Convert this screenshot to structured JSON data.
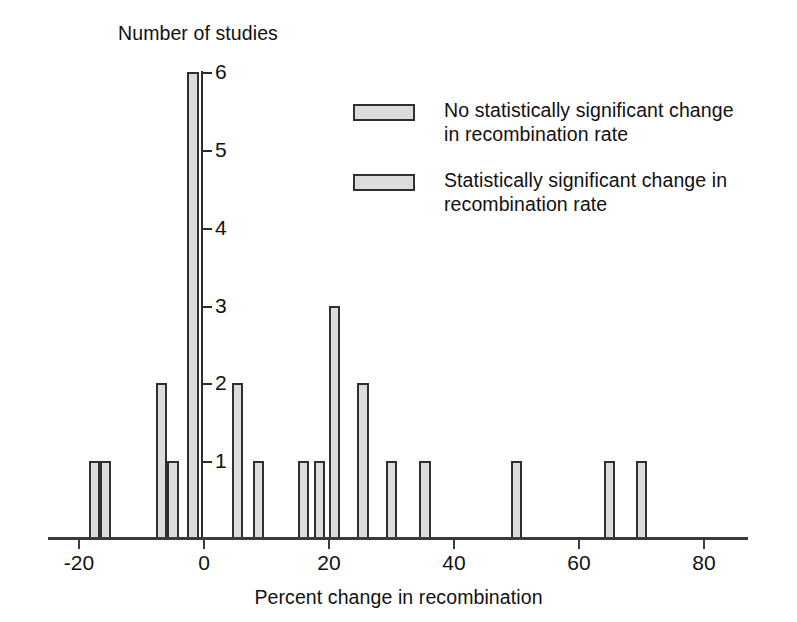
{
  "chart_data": {
    "type": "bar",
    "title": "",
    "ylabel": "Number of studies",
    "xlabel": "Percent change in recombination",
    "xlim": [
      -24,
      88
    ],
    "ylim": [
      0,
      6
    ],
    "grid": false,
    "x_ticks": [
      -20,
      0,
      20,
      40,
      60,
      80
    ],
    "x_tick_labels": [
      "-20",
      "0",
      "20",
      "40",
      "60",
      "80"
    ],
    "y_ticks": [
      1,
      2,
      3,
      4,
      5,
      6
    ],
    "y_tick_labels": [
      "1",
      "2",
      "3",
      "4",
      "5",
      "6"
    ],
    "bar_width_units": 1.8,
    "legend_position": "upper right",
    "bars": [
      {
        "x": -17.4,
        "value": 1,
        "series": "Statistically significant change in recombination rate"
      },
      {
        "x": -15.6,
        "value": 1,
        "series": "Statistically significant change in recombination rate"
      },
      {
        "x": -6.7,
        "value": 2,
        "series": "No statistically significant change in recombination rate"
      },
      {
        "x": -4.8,
        "value": 1,
        "series": "No statistically significant change in recombination rate"
      },
      {
        "x": -1.6,
        "value": 6,
        "series": "No statistically significant change in recombination rate"
      },
      {
        "x": 5.5,
        "value": 2,
        "series": "No statistically significant change in recombination rate"
      },
      {
        "x": 8.9,
        "value": 1,
        "series": "No statistically significant change in recombination rate"
      },
      {
        "x": 16.1,
        "value": 1,
        "series": "Statistically significant change in recombination rate"
      },
      {
        "x": 18.6,
        "value": 1,
        "series": "Statistically significant change in recombination rate"
      },
      {
        "x": 21.0,
        "value": 3,
        "series": "Statistically significant change in recombination rate"
      },
      {
        "x": 25.6,
        "value": 2,
        "series": "Statistically significant change in recombination rate"
      },
      {
        "x": 30.1,
        "value": 1,
        "series": "Statistically significant change in recombination rate"
      },
      {
        "x": 35.5,
        "value": 1,
        "series": "Statistically significant change in recombination rate"
      },
      {
        "x": 50.2,
        "value": 1,
        "series": "Statistically significant change in recombination rate"
      },
      {
        "x": 65.0,
        "value": 1,
        "series": "Statistically significant change in recombination rate"
      },
      {
        "x": 70.1,
        "value": 1,
        "series": "Statistically significant change in recombination rate"
      }
    ],
    "series": [
      {
        "name": "No statistically significant change in recombination rate",
        "legend_label": "No statistically significant change\nin recombination rate",
        "color": "#dcdcdc",
        "edge_color": "#2f2f2f"
      },
      {
        "name": "Statistically significant change in recombination rate",
        "legend_label": "Statistically significant change in\nrecombination rate",
        "color": "#dcdcdc",
        "edge_color": "#2f2f2f"
      }
    ]
  },
  "colors": {
    "bar_fill": "#dcdcdc",
    "bar_edge": "#2f2f2f",
    "axis": "#3b3b3b",
    "text": "#111111",
    "background": "#ffffff"
  }
}
